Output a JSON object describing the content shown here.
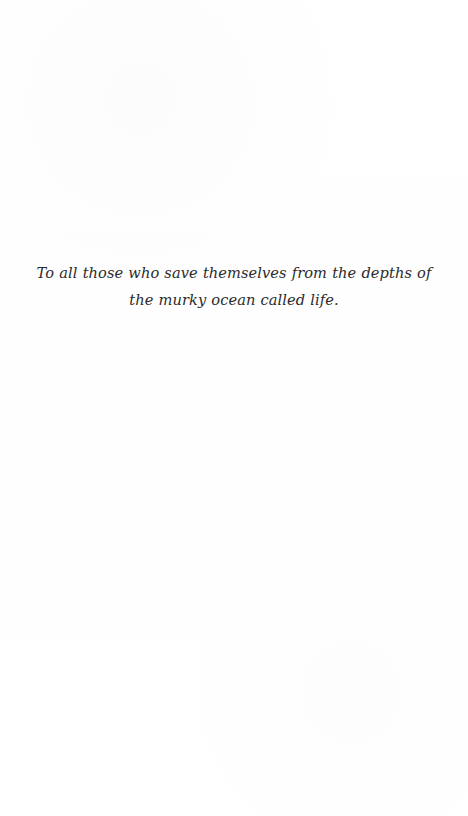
{
  "page": {
    "kind": "book-dedication-page",
    "background_color": "#ffffff",
    "width": 468,
    "height": 816
  },
  "dedication": {
    "text": "To all those who save themselves from the depths of the murky ocean called life.",
    "style": "italic",
    "alignment": "center",
    "text_color": "#2b2b2b"
  }
}
